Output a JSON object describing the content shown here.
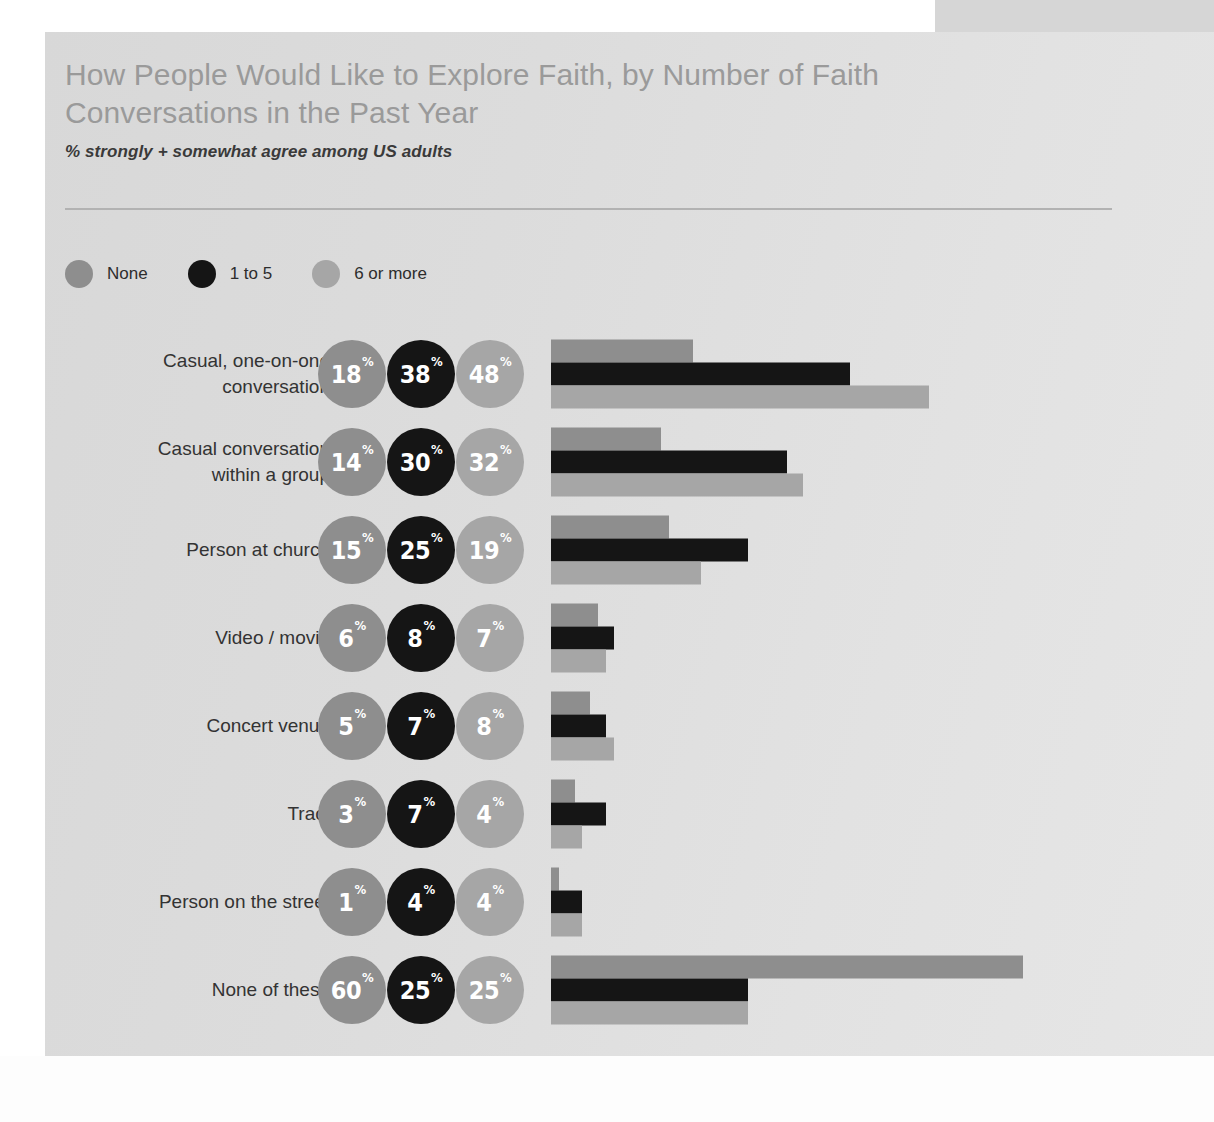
{
  "header": {
    "title": "How People Would Like to Explore Faith, by Number of Faith Conversations in the Past Year",
    "subtitle": "% strongly + somewhat agree among US adults"
  },
  "colors": {
    "none": "#8e8e8e",
    "one_to_five": "#151515",
    "six_or_more": "#a6a6a6",
    "card_bg": "#dcdcdc",
    "title_text": "#9a9a9a",
    "body_text": "#333333",
    "rule": "#b2b2b2"
  },
  "legend": {
    "items": [
      {
        "label": "None",
        "color": "#8e8e8e"
      },
      {
        "label": "1 to 5",
        "color": "#151515"
      },
      {
        "label": "6 or more",
        "color": "#a6a6a6"
      }
    ]
  },
  "chart_data": {
    "type": "bar",
    "title": "How People Would Like to Explore Faith, by Number of Faith Conversations in the Past Year",
    "subtitle": "% strongly + somewhat agree among US adults",
    "xlabel": "",
    "ylabel": "",
    "unit": "%",
    "orientation": "horizontal",
    "grid": false,
    "legend_position": "top-left",
    "xlim": [
      0,
      60
    ],
    "categories": [
      "Casual, one-on-one conversation",
      "Casual conversation within a group",
      "Person at church",
      "Video / movie",
      "Concert venue",
      "Tract",
      "Person on the street",
      "None of these"
    ],
    "series": [
      {
        "name": "None",
        "color": "#8e8e8e",
        "values": [
          18,
          14,
          15,
          6,
          5,
          3,
          1,
          60
        ]
      },
      {
        "name": "1 to 5",
        "color": "#151515",
        "values": [
          38,
          30,
          25,
          8,
          7,
          7,
          4,
          25
        ]
      },
      {
        "name": "6 or more",
        "color": "#a6a6a6",
        "values": [
          48,
          32,
          19,
          7,
          8,
          4,
          4,
          25
        ]
      }
    ]
  },
  "rows": [
    {
      "label": "Casual, one-on-one\nconversation",
      "values": [
        {
          "series": "None",
          "value": "18",
          "pct": "%",
          "color": "#8e8e8e"
        },
        {
          "series": "1 to 5",
          "value": "38",
          "pct": "%",
          "color": "#151515"
        },
        {
          "series": "6 or more",
          "value": "48",
          "pct": "%",
          "color": "#a6a6a6"
        }
      ]
    },
    {
      "label": "Casual conversation\nwithin a group",
      "values": [
        {
          "series": "None",
          "value": "14",
          "pct": "%",
          "color": "#8e8e8e"
        },
        {
          "series": "1 to 5",
          "value": "30",
          "pct": "%",
          "color": "#151515"
        },
        {
          "series": "6 or more",
          "value": "32",
          "pct": "%",
          "color": "#a6a6a6"
        }
      ]
    },
    {
      "label": "Person at church",
      "values": [
        {
          "series": "None",
          "value": "15",
          "pct": "%",
          "color": "#8e8e8e"
        },
        {
          "series": "1 to 5",
          "value": "25",
          "pct": "%",
          "color": "#151515"
        },
        {
          "series": "6 or more",
          "value": "19",
          "pct": "%",
          "color": "#a6a6a6"
        }
      ]
    },
    {
      "label": "Video / movie",
      "values": [
        {
          "series": "None",
          "value": "6",
          "pct": "%",
          "color": "#8e8e8e"
        },
        {
          "series": "1 to 5",
          "value": "8",
          "pct": "%",
          "color": "#151515"
        },
        {
          "series": "6 or more",
          "value": "7",
          "pct": "%",
          "color": "#a6a6a6"
        }
      ]
    },
    {
      "label": "Concert venue",
      "values": [
        {
          "series": "None",
          "value": "5",
          "pct": "%",
          "color": "#8e8e8e"
        },
        {
          "series": "1 to 5",
          "value": "7",
          "pct": "%",
          "color": "#151515"
        },
        {
          "series": "6 or more",
          "value": "8",
          "pct": "%",
          "color": "#a6a6a6"
        }
      ]
    },
    {
      "label": "Tract",
      "values": [
        {
          "series": "None",
          "value": "3",
          "pct": "%",
          "color": "#8e8e8e"
        },
        {
          "series": "1 to 5",
          "value": "7",
          "pct": "%",
          "color": "#151515"
        },
        {
          "series": "6 or more",
          "value": "4",
          "pct": "%",
          "color": "#a6a6a6"
        }
      ]
    },
    {
      "label": "Person on the street",
      "values": [
        {
          "series": "None",
          "value": "1",
          "pct": "%",
          "color": "#8e8e8e"
        },
        {
          "series": "1 to 5",
          "value": "4",
          "pct": "%",
          "color": "#151515"
        },
        {
          "series": "6 or more",
          "value": "4",
          "pct": "%",
          "color": "#a6a6a6"
        }
      ]
    },
    {
      "label": "None of these",
      "values": [
        {
          "series": "None",
          "value": "60",
          "pct": "%",
          "color": "#8e8e8e"
        },
        {
          "series": "1 to 5",
          "value": "25",
          "pct": "%",
          "color": "#151515"
        },
        {
          "series": "6 or more",
          "value": "25",
          "pct": "%",
          "color": "#a6a6a6"
        }
      ]
    }
  ]
}
